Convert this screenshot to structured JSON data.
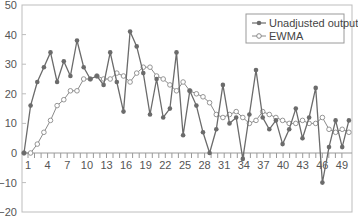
{
  "chart_data": {
    "type": "line",
    "title": "",
    "xlabel": "",
    "ylabel": "",
    "ylim": [
      -20,
      50
    ],
    "xlim": [
      0,
      49
    ],
    "grid": false,
    "legend_position": "upper right",
    "x_tick_labels": [
      "1",
      "4",
      "7",
      "10",
      "13",
      "16",
      "19",
      "22",
      "25",
      "28",
      "31",
      "34",
      "37",
      "40",
      "43",
      "46",
      "49"
    ],
    "y_tick_labels": [
      "50",
      "40",
      "30",
      "20",
      "10",
      "0",
      "−10",
      "−20"
    ],
    "x": [
      0,
      1,
      2,
      3,
      4,
      5,
      6,
      7,
      8,
      9,
      10,
      11,
      12,
      13,
      14,
      15,
      16,
      17,
      18,
      19,
      20,
      21,
      22,
      23,
      24,
      25,
      26,
      27,
      28,
      29,
      30,
      31,
      32,
      33,
      34,
      35,
      36,
      37,
      38,
      39,
      40,
      41,
      42,
      43,
      44,
      45,
      46,
      47,
      48,
      49
    ],
    "series": [
      {
        "name": "Unadjusted output",
        "marker": "filled-circle",
        "color": "#6b6b6b",
        "values": [
          0,
          16,
          24,
          29,
          34,
          24,
          31,
          26,
          38,
          29,
          25,
          26,
          23,
          34,
          24,
          14,
          41,
          36,
          27,
          13,
          25,
          12,
          15,
          34,
          6,
          21,
          16,
          7,
          0,
          8,
          23,
          10,
          12,
          -2,
          13,
          28,
          12,
          8,
          11,
          3,
          8,
          15,
          5,
          12,
          22,
          -10,
          2,
          11,
          2,
          11
        ]
      },
      {
        "name": "EWMA",
        "marker": "open-circle",
        "color": "#8a8a8a",
        "values": [
          0,
          0,
          3,
          7,
          11,
          16,
          18,
          21,
          21,
          25,
          25,
          26,
          25,
          25,
          27,
          26,
          24,
          27,
          29,
          29,
          26,
          25,
          23,
          21,
          24,
          21,
          20,
          19,
          17,
          13,
          12,
          13,
          14,
          12,
          10,
          11,
          14,
          13,
          12,
          11,
          10,
          10,
          11,
          10,
          10,
          12,
          8,
          7,
          8,
          7
        ]
      }
    ]
  }
}
